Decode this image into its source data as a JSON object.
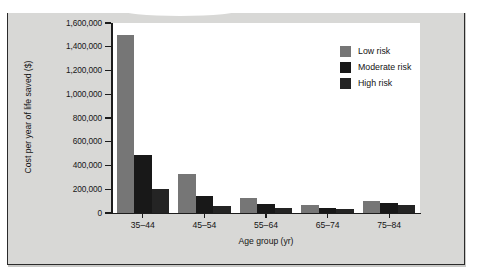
{
  "figure": {
    "background_color": "#d8d8d6",
    "plot_background_color": "#ffffff",
    "border_color": "#2b2b2b"
  },
  "chart_data": {
    "type": "bar",
    "title": "",
    "xlabel": "Age group (yr)",
    "ylabel": "Cost per year of life saved ($)",
    "categories": [
      "35–44",
      "45–54",
      "55–64",
      "65–74",
      "75–84"
    ],
    "series": [
      {
        "name": "Low risk",
        "color": "#767676",
        "values": [
          1500000,
          325000,
          125000,
          68000,
          100000
        ]
      },
      {
        "name": "Moderate risk",
        "color": "#181818",
        "values": [
          485000,
          142000,
          78000,
          40000,
          82000
        ]
      },
      {
        "name": "High risk",
        "color": "#242424",
        "values": [
          200000,
          57000,
          42000,
          32000,
          65000
        ]
      }
    ],
    "ylim": [
      0,
      1600000
    ],
    "ytick_values": [
      0,
      200000,
      400000,
      600000,
      800000,
      1000000,
      1200000,
      1400000,
      1600000
    ],
    "ytick_labels": [
      "0",
      "200,000",
      "400,000",
      "600,000",
      "800,000",
      "1,000,000",
      "1,200,000",
      "1,400,000",
      "1,600,000"
    ],
    "grid": false,
    "legend_position": "top-right"
  },
  "legend": {
    "entries": [
      {
        "label": "Low risk",
        "color": "#767676"
      },
      {
        "label": "Moderate risk",
        "color": "#181818"
      },
      {
        "label": "High risk",
        "color": "#242424"
      }
    ]
  }
}
